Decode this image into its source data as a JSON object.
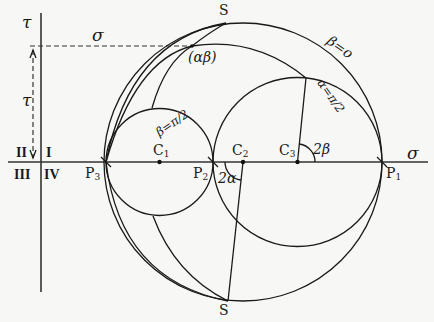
{
  "diagram": {
    "type": "Mohr circle construction",
    "axes": {
      "horizontal_label": "σ",
      "vertical_label": "τ",
      "dashed_sigma_label": "σ",
      "dashed_tau_label": "τ"
    },
    "quadrants": [
      "I",
      "II",
      "III",
      "IV"
    ],
    "points": {
      "P1": "P1",
      "P2": "P2",
      "P3": "P3",
      "C1": "C1",
      "C2": "C2",
      "C3": "C3",
      "S_top": "S",
      "S_bottom": "S",
      "alpha_beta": "(αβ)"
    },
    "curve_labels": {
      "beta_zero": "β=o",
      "alpha_half_pi": "α=π/2",
      "beta_half_pi": "β=π/2"
    },
    "angles": {
      "two_alpha": "2α",
      "two_beta": "2β"
    }
  }
}
